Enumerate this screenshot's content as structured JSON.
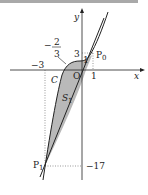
{
  "figure": {
    "type": "math-diagram",
    "axes": {
      "x_label": "x",
      "y_label": "y",
      "origin_label": "O"
    },
    "labels": {
      "curve": "C",
      "region": "S",
      "region_sub": "1",
      "point_p0": "P",
      "point_p0_sub": "0",
      "point_p1": "P",
      "point_p1_sub": "1",
      "x_tick_neg3": "−3",
      "x_tick_1": "1",
      "y_tick_3": "3",
      "y_tick_1": "1",
      "y_tick_neg17": "−17",
      "frac_sign": "−",
      "frac_num": "2",
      "frac_den": "3"
    },
    "colors": {
      "shade": "#b9b9b9",
      "line": "#222222",
      "bar": "#a9a9a9"
    }
  }
}
